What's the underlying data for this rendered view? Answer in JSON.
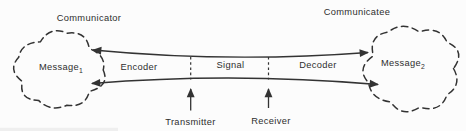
{
  "figure": {
    "left_party_label": "Communicator",
    "right_party_label": "Communicatee",
    "left_message": {
      "base": "Message",
      "sub": "1"
    },
    "right_message": {
      "base": "Message",
      "sub": "2"
    },
    "channel": {
      "encoder_label": "Encoder",
      "signal_label": "Signal",
      "decoder_label": "Decoder"
    },
    "bottom": {
      "transmitter_label": "Transmitter",
      "receiver_label": "Receiver"
    },
    "colors": {
      "line": "#333333",
      "text": "#2e2e2e",
      "background": "#fcfcfc"
    }
  }
}
